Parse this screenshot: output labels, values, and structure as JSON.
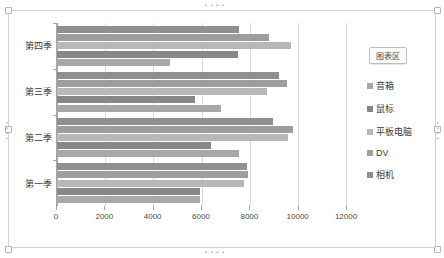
{
  "chart_area_tip": "图表区",
  "legend": {
    "position": "right",
    "items": [
      {
        "label": "音箱",
        "color": "#a8a8a8"
      },
      {
        "label": "鼠标",
        "color": "#888888"
      },
      {
        "label": "平板电脑",
        "color": "#b8b8b8"
      },
      {
        "label": "DV",
        "color": "#9e9e9e"
      },
      {
        "label": "相机",
        "color": "#8f8f8f"
      }
    ]
  },
  "axis": {
    "x_ticks": [
      "0",
      "2000",
      "4000",
      "6000",
      "8000",
      "10000",
      "12000"
    ],
    "y_categories_top_down": [
      "第四季",
      "第三季",
      "第二季",
      "第一季"
    ]
  },
  "chart_data": {
    "type": "bar",
    "orientation": "horizontal",
    "title": "",
    "xlabel": "",
    "ylabel": "",
    "xlim": [
      0,
      12000
    ],
    "xtick_step": 2000,
    "grid": true,
    "legend_position": "right",
    "categories": [
      "第一季",
      "第二季",
      "第三季",
      "第四季"
    ],
    "categories_display_order_top_down": [
      "第四季",
      "第三季",
      "第二季",
      "第一季"
    ],
    "series": [
      {
        "name": "音箱",
        "color": "#a8a8a8",
        "values": [
          5950,
          7550,
          6800,
          4700
        ]
      },
      {
        "name": "鼠标",
        "color": "#888888",
        "values": [
          5950,
          6400,
          5750,
          7500
        ]
      },
      {
        "name": "平板电脑",
        "color": "#b8b8b8",
        "values": [
          7750,
          9600,
          8700,
          9700
        ]
      },
      {
        "name": "DV",
        "color": "#9e9e9e",
        "values": [
          7950,
          9800,
          9550,
          8800
        ]
      },
      {
        "name": "相机",
        "color": "#8f8f8f",
        "values": [
          7900,
          8950,
          9200,
          7550
        ]
      }
    ]
  },
  "selection_dots": "• • • •"
}
